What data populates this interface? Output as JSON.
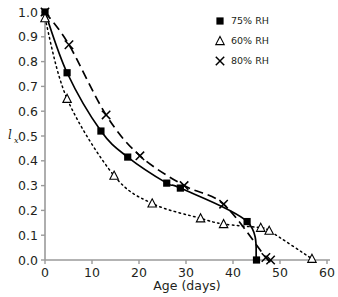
{
  "chart_data": {
    "type": "line",
    "title": "",
    "subtitle": "",
    "xlabel": "Age (days)",
    "ylabel": "lx",
    "ylabel_base": "l",
    "ylabel_subscript": "x",
    "xlim": [
      0,
      60
    ],
    "ylim": [
      0,
      1.0
    ],
    "xticks": [
      0,
      10,
      20,
      30,
      40,
      50,
      60
    ],
    "xtick_labels": [
      "0",
      "10",
      "20",
      "30",
      "40",
      "50",
      "60"
    ],
    "yticks": [
      0.0,
      0.1,
      0.2,
      0.3,
      0.4,
      0.5,
      0.6,
      0.7,
      0.8,
      0.9,
      1.0
    ],
    "ytick_labels": [
      "0.0",
      "0.1",
      "0.2",
      "0.3",
      "0.4",
      "0.5",
      "0.6",
      "0.7",
      "0.8",
      "0.9",
      "1.0"
    ],
    "grid": false,
    "legend_position": "top-right",
    "series": [
      {
        "name": "75% RH",
        "marker": "filled-square",
        "line_style": "solid",
        "color": "#000000",
        "x": [
          0,
          4.7,
          11.9,
          17.6,
          25.9,
          28.8,
          43.0,
          45.0
        ],
        "y": [
          1.0,
          0.755,
          0.52,
          0.415,
          0.31,
          0.29,
          0.155,
          0.0
        ]
      },
      {
        "name": "60% RH",
        "marker": "open-triangle",
        "line_style": "dotted",
        "color": "#000000",
        "x": [
          0,
          4.7,
          14.7,
          22.8,
          33.1,
          38.0,
          45.9,
          47.7,
          56.8
        ],
        "y": [
          0.975,
          0.65,
          0.34,
          0.228,
          0.168,
          0.145,
          0.13,
          0.118,
          0.005
        ]
      },
      {
        "name": "80% RH",
        "marker": "cross",
        "line_style": "dashed",
        "color": "#000000",
        "x": [
          0,
          5.1,
          13.0,
          20.2,
          29.6,
          38.0,
          47.0,
          48.0
        ],
        "y": [
          1.0,
          0.868,
          0.585,
          0.42,
          0.3,
          0.225,
          0.01,
          0.0
        ]
      }
    ]
  },
  "legend": {
    "entries": [
      {
        "label": "75% RH",
        "marker": "filled-square"
      },
      {
        "label": "60% RH",
        "marker": "open-triangle"
      },
      {
        "label": "80% RH",
        "marker": "cross"
      }
    ]
  },
  "axes": {
    "x_title": "Age (days)",
    "y_title_base": "l",
    "y_title_sub": "x"
  }
}
